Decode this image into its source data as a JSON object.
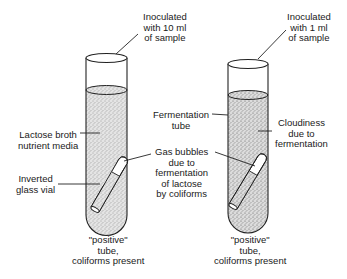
{
  "diagram": {
    "left_tube": {
      "inoculation": [
        "Inoculated",
        "with 10 ml",
        "of sample"
      ],
      "media_label": [
        "Lactose broth",
        "nutrient media"
      ],
      "vial_label": [
        "Inverted",
        "glass vial"
      ],
      "result": [
        "\"positive\"",
        "tube,",
        "coliforms present"
      ]
    },
    "middle_labels": {
      "fermentation_tube": [
        "Fermentation",
        "tube"
      ],
      "gas_bubbles": [
        "Gas bubbles",
        "due to",
        "fermentation",
        "of lactose",
        "by coliforms"
      ]
    },
    "right_tube": {
      "inoculation": [
        "Inoculated",
        "with 1 ml",
        "of sample"
      ],
      "cloudiness_label": [
        "Cloudiness",
        "due to",
        "fermentation"
      ],
      "result": [
        "\"positive\"",
        "tube,",
        "coliforms present"
      ]
    }
  }
}
